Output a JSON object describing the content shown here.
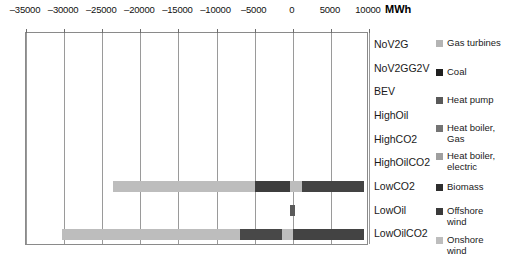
{
  "chart_data": {
    "type": "bar",
    "orientation": "horizontal",
    "stacked": true,
    "title": "",
    "xlabel": "MWh",
    "ylabel": "",
    "unit": "MWh",
    "xlim": [
      -35000,
      10000
    ],
    "xticks": [
      -35000,
      -30000,
      -25000,
      -20000,
      -15000,
      -10000,
      -5000,
      0,
      5000,
      10000
    ],
    "xtick_labels": [
      "–35000",
      "–30000",
      "–25000",
      "–20000",
      "–15000",
      "–10000",
      "–5000",
      "0",
      "5000",
      "10000"
    ],
    "grid": true,
    "grid_axis": "x",
    "legend_position": "right",
    "categories": [
      "NoV2G",
      "NoV2GG2V",
      "BEV",
      "HighOil",
      "HighCO2",
      "HighOilCO2",
      "LowCO2",
      "LowOil",
      "LowOilCO2"
    ],
    "series": [
      {
        "name": "Gas turbines",
        "color": "#b4b4b4",
        "values": [
          0,
          0,
          0,
          0,
          0,
          0,
          0,
          0,
          0
        ]
      },
      {
        "name": "Coal",
        "color": "#2b2b2b",
        "values": [
          0,
          0,
          0,
          0,
          0,
          0,
          0,
          0,
          0
        ]
      },
      {
        "name": "Heat pump",
        "color": "#4f4f4f",
        "values": [
          0,
          0,
          0,
          0,
          0,
          0,
          0,
          0,
          0
        ]
      },
      {
        "name": "Heat boiler, Gas",
        "color": "#6e6e6e",
        "values": [
          0,
          0,
          0,
          0,
          0,
          0,
          0,
          0,
          0
        ]
      },
      {
        "name": "Heat boiler, electric",
        "color": "#9a9a9a",
        "values": [
          0,
          0,
          0,
          0,
          0,
          0,
          0,
          0,
          0
        ]
      },
      {
        "name": "Biomass",
        "color": "#383838",
        "values": [
          0,
          0,
          0,
          0,
          0,
          0,
          4600,
          0,
          1500
        ]
      },
      {
        "name": "Offshore wind",
        "color": "#434343",
        "values": [
          0,
          0,
          0,
          0,
          0,
          0,
          8300,
          500,
          9400
        ]
      },
      {
        "name": "Onshore wind",
        "color": "#bdbdbd",
        "values": [
          0,
          0,
          0,
          0,
          0,
          0,
          -26900,
          0,
          -31300
        ]
      }
    ],
    "bars": [
      {
        "category": "NoV2G",
        "segments": []
      },
      {
        "category": "NoV2GG2V",
        "segments": []
      },
      {
        "category": "BEV",
        "segments": []
      },
      {
        "category": "HighOil",
        "segments": []
      },
      {
        "category": "HighCO2",
        "segments": []
      },
      {
        "category": "HighOilCO2",
        "segments": []
      },
      {
        "category": "LowCO2",
        "segments": [
          {
            "series": "Onshore wind",
            "from": -23600,
            "to": -4900,
            "color": "#bdbdbd"
          },
          {
            "series": "Biomass",
            "from": -4900,
            "to": -350,
            "color": "#3d3d3d"
          },
          {
            "series": "Heat boiler, electric",
            "from": -350,
            "to": 1150,
            "color": "#bdbdbd"
          },
          {
            "series": "Offshore wind",
            "from": 1150,
            "to": 9400,
            "color": "#434343"
          }
        ]
      },
      {
        "category": "LowOil",
        "segments": [
          {
            "series": "Offshore wind",
            "from": -300,
            "to": 300,
            "color": "#5a5a5a"
          }
        ]
      },
      {
        "category": "LowOilCO2",
        "segments": [
          {
            "series": "Onshore wind",
            "from": -30300,
            "to": -6900,
            "color": "#bdbdbd"
          },
          {
            "series": "Biomass",
            "from": -6900,
            "to": -1400,
            "color": "#484848"
          },
          {
            "series": "Heat boiler, electric",
            "from": -1400,
            "to": 0,
            "color": "#bdbdbd"
          },
          {
            "series": "Offshore wind",
            "from": 0,
            "to": 9400,
            "color": "#434343"
          }
        ]
      }
    ],
    "legend_entries": [
      {
        "label": "Gas turbines",
        "color": "#b4b4b4"
      },
      {
        "label": "Coal",
        "color": "#1f1f1f"
      },
      {
        "label": "Heat pump",
        "color": "#595959"
      },
      {
        "label": "Heat boiler,\nGas",
        "color": "#747474"
      },
      {
        "label": "Heat boiler,\nelectric",
        "color": "#9f9f9f"
      },
      {
        "label": "Biomass",
        "color": "#2e2e2e"
      },
      {
        "label": "Offshore\nwind",
        "color": "#3a3a3a"
      },
      {
        "label": "Onshore\nwind",
        "color": "#bdbdbd"
      }
    ]
  },
  "colors": {
    "axis": "#8a8a8a",
    "grid": "#9a9a9a",
    "text": "#1a1a1a",
    "background": "#ffffff"
  }
}
